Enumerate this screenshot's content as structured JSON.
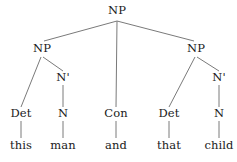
{
  "figure": {
    "kind": "syntax-tree",
    "sentence": "this man and that child",
    "line_color": "#7a7a7a",
    "text_color": "#1a1a1a",
    "background_color": "#ffffff",
    "width": 237,
    "height": 162
  },
  "nodes": {
    "root": {
      "label": "NP",
      "x": 117,
      "y": 11
    },
    "np_left": {
      "label": "NP",
      "x": 42,
      "y": 49
    },
    "np_right": {
      "label": "NP",
      "x": 196,
      "y": 49
    },
    "nbar_left": {
      "label": "N'",
      "x": 63,
      "y": 78
    },
    "nbar_right": {
      "label": "N'",
      "x": 219,
      "y": 78
    },
    "pos1": {
      "label": "Det",
      "x": 21,
      "y": 114
    },
    "pos2": {
      "label": "N",
      "x": 63,
      "y": 114
    },
    "pos3": {
      "label": "Con",
      "x": 116,
      "y": 114
    },
    "pos4": {
      "label": "Det",
      "x": 169,
      "y": 114
    },
    "pos5": {
      "label": "N",
      "x": 219,
      "y": 114
    },
    "word1": {
      "label": "this",
      "x": 21,
      "y": 146
    },
    "word2": {
      "label": "man",
      "x": 63,
      "y": 146
    },
    "word3": {
      "label": "and",
      "x": 116,
      "y": 146
    },
    "word4": {
      "label": "that",
      "x": 169,
      "y": 146
    },
    "word5": {
      "label": "child",
      "x": 219,
      "y": 146
    }
  },
  "edges": [
    {
      "name": "root-to-np-left",
      "x1": 117,
      "y1": 21,
      "x2": 44,
      "y2": 41
    },
    {
      "name": "root-to-con",
      "x1": 117,
      "y1": 21,
      "x2": 116,
      "y2": 107
    },
    {
      "name": "root-to-np-right",
      "x1": 117,
      "y1": 21,
      "x2": 194,
      "y2": 41
    },
    {
      "name": "np-left-to-det",
      "x1": 41,
      "y1": 57,
      "x2": 21,
      "y2": 107
    },
    {
      "name": "np-left-to-nbar",
      "x1": 43,
      "y1": 57,
      "x2": 63,
      "y2": 71
    },
    {
      "name": "nbar-left-to-n",
      "x1": 63,
      "y1": 85,
      "x2": 63,
      "y2": 107
    },
    {
      "name": "np-right-to-det",
      "x1": 195,
      "y1": 57,
      "x2": 169,
      "y2": 107
    },
    {
      "name": "np-right-to-nbar",
      "x1": 197,
      "y1": 57,
      "x2": 219,
      "y2": 71
    },
    {
      "name": "nbar-right-to-n",
      "x1": 219,
      "y1": 85,
      "x2": 219,
      "y2": 107
    },
    {
      "name": "det1-to-this",
      "x1": 21,
      "y1": 121,
      "x2": 21,
      "y2": 138
    },
    {
      "name": "n1-to-man",
      "x1": 63,
      "y1": 121,
      "x2": 63,
      "y2": 138
    },
    {
      "name": "con-to-and",
      "x1": 116,
      "y1": 121,
      "x2": 116,
      "y2": 138
    },
    {
      "name": "det2-to-that",
      "x1": 169,
      "y1": 121,
      "x2": 169,
      "y2": 138
    },
    {
      "name": "n2-to-child",
      "x1": 219,
      "y1": 121,
      "x2": 219,
      "y2": 138
    }
  ]
}
